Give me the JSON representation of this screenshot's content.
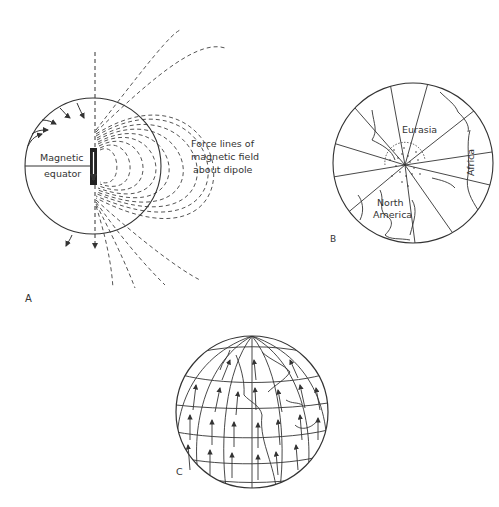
{
  "figure": {
    "panels": [
      {
        "id": "A",
        "label": "A",
        "description": "Dipole magnetic field of Earth",
        "equator_label_line1": "Magnetic",
        "equator_label_line2": "equator",
        "field_label_line1": "Force lines of",
        "field_label_line2": "magnetic field",
        "field_label_line3": "about dipole"
      },
      {
        "id": "B",
        "label": "B",
        "description": "Polar projection with continents",
        "continents": [
          "Eurasia",
          "North America",
          "Africa"
        ],
        "north_label": "North",
        "america_label": "America",
        "eurasia_label": "Eurasia",
        "africa_label": "Africa"
      },
      {
        "id": "C",
        "label": "C",
        "description": "Globe with arrows indicating magnetic field direction"
      }
    ],
    "colors": {
      "ink": "#333333",
      "background": "#ffffff"
    }
  }
}
